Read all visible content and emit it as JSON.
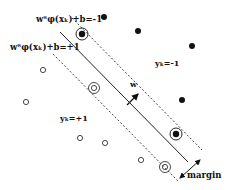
{
  "diagram": {
    "colors": {
      "ink": "#111111",
      "background": "#ffffff"
    },
    "labels": {
      "upper_margin": "wᵀφ(xₖ)+b=-1",
      "lower_margin": "wᵀφ(xₖ)+b=+1",
      "w": "w",
      "class_neg": "yₖ=-1",
      "class_pos": "yₖ=+1",
      "margin": "margin"
    },
    "lines": {
      "hyperplane": {
        "x1": 60,
        "y1": 32,
        "x2": 188,
        "y2": 162
      },
      "upper_margin": {
        "x1": 72,
        "y1": 18,
        "x2": 202,
        "y2": 150
      },
      "lower_margin": {
        "x1": 53,
        "y1": 54,
        "x2": 178,
        "y2": 181
      }
    },
    "filled_points": [
      {
        "x": 104,
        "y": 17
      },
      {
        "x": 138,
        "y": 31
      },
      {
        "x": 192,
        "y": 46
      },
      {
        "x": 182,
        "y": 100
      }
    ],
    "open_points": [
      {
        "x": 43,
        "y": 70
      },
      {
        "x": 26,
        "y": 102
      },
      {
        "x": 80,
        "y": 138
      },
      {
        "x": 105,
        "y": 143
      },
      {
        "x": 141,
        "y": 160
      }
    ],
    "support_vectors": [
      {
        "x": 82,
        "y": 34,
        "type": "filled"
      },
      {
        "x": 176,
        "y": 134,
        "type": "filled"
      },
      {
        "x": 94,
        "y": 88,
        "type": "open"
      },
      {
        "x": 165,
        "y": 167,
        "type": "open"
      }
    ]
  }
}
